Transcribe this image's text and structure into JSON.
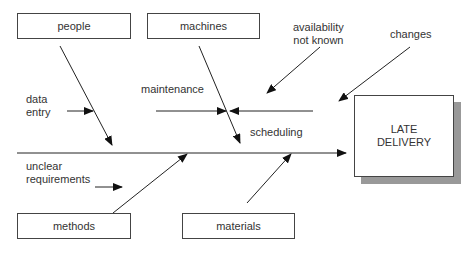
{
  "diagram": {
    "type": "fishbone",
    "effect": {
      "line1": "LATE",
      "line2": "DELIVERY"
    },
    "categories": {
      "people": "people",
      "machines": "machines",
      "methods": "methods",
      "materials": "materials"
    },
    "causes": {
      "data_entry": {
        "line1": "data",
        "line2": "entry"
      },
      "maintenance": "maintenance",
      "availability": {
        "line1": "availability",
        "line2": "not known"
      },
      "changes": "changes",
      "scheduling": "scheduling",
      "unclear": {
        "line1": "unclear",
        "line2": "requirements"
      }
    },
    "colors": {
      "line": "#222222",
      "shadow": "#999999",
      "border": "#444444"
    }
  }
}
